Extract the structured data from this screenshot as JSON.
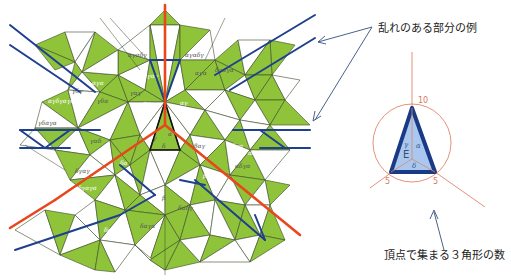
{
  "annotations": {
    "disorder_example": "乱れのある部分の例",
    "vertex_count": "頂点で集まる３角形の数"
  },
  "inset": {
    "vertex_top": "10",
    "vertex_left": "5",
    "vertex_right": "5",
    "center_label": "E",
    "angles": [
      "α",
      "γ",
      "δ"
    ]
  },
  "center_angles": [
    "γ",
    "α",
    "δ"
  ],
  "tile_labels": [
    "αγαδγ",
    "αγαγ",
    "αγαδγ",
    "αγα",
    "γαγ",
    "αγ",
    "αγ",
    "δγαγα",
    "αγδγαγα",
    "γδγ",
    "γδα",
    "αγα",
    "γδαγα",
    "αδγα",
    "αδγα",
    "αδγαγ",
    "δγαγ",
    "δγαγα",
    "βαγ",
    "βαγα",
    "δαγα",
    "δαδγ",
    "δαγα",
    "γαδ",
    "δα",
    "β"
  ],
  "colors": {
    "green": "#8fc43a",
    "white": "#ffffff",
    "edge": "#3a4a2a",
    "blue": "#1f3f8f",
    "red": "#e8471c",
    "circle": "#e0876a",
    "inset_fill": "#a9c7ef",
    "arrow": "#34507f"
  }
}
